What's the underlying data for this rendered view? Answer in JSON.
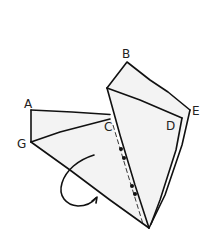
{
  "figure": {
    "type": "origami fold diagram",
    "labels": {
      "A": "A",
      "B": "B",
      "C": "C",
      "D": "D",
      "E": "E",
      "G": "G"
    },
    "colors": {
      "line": "#111111",
      "paper": "#f3f3f3",
      "background": "#ffffff"
    },
    "annotations": {
      "fold_arrow": "curved arrow indicating fold direction",
      "dotted_line": "dotted crease line from C to bottom tip with four dots"
    }
  }
}
